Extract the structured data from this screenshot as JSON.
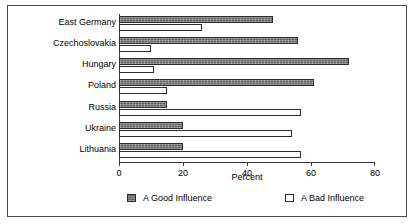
{
  "chart_data": {
    "type": "bar",
    "orientation": "horizontal",
    "title": "",
    "xlabel": "Percent",
    "ylabel": "",
    "xlim": [
      0,
      80
    ],
    "xticks": [
      0,
      20,
      40,
      60,
      80
    ],
    "xtick_labels": [
      "0",
      "20",
      "40",
      "60",
      "80"
    ],
    "grid": false,
    "legend_position": "bottom",
    "categories": [
      "East Germany",
      "Czechoslovakia",
      "Hungary",
      "Poland",
      "Russia",
      "Ukraine",
      "Lithuania"
    ],
    "series": [
      {
        "name": "A Good Influence",
        "swatch": "hatched-gray",
        "color": "#5e5e5e",
        "values": [
          48,
          56,
          72,
          61,
          15,
          20,
          20
        ]
      },
      {
        "name": "A Bad Influence",
        "swatch": "white",
        "color": "#ffffff",
        "values": [
          26,
          10,
          11,
          15,
          57,
          54,
          57
        ]
      }
    ]
  },
  "legend": {
    "items": [
      {
        "label": "A Good Influence"
      },
      {
        "label": "A Bad Influence"
      }
    ]
  },
  "axis": {
    "x_title": "Percent"
  }
}
